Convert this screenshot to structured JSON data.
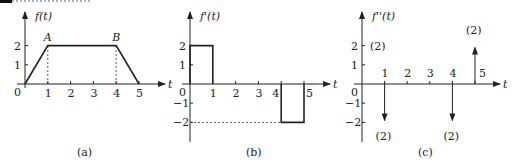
{
  "chart_data": [
    {
      "type": "line",
      "panel": "a",
      "caption": "(a)",
      "ylabel": "f(t)",
      "xlabel": "t",
      "x_ticks": [
        "1",
        "2",
        "3",
        "4",
        "5"
      ],
      "y_ticks": [
        "1",
        "2"
      ],
      "origin_label": "0",
      "points": [
        [
          0,
          0
        ],
        [
          1,
          2
        ],
        [
          4,
          2
        ],
        [
          5,
          0
        ]
      ],
      "annotations": [
        {
          "label": "A",
          "x": 1,
          "y": 2
        },
        {
          "label": "B",
          "x": 4,
          "y": 2
        }
      ],
      "dashed_guides": [
        {
          "x": 1,
          "from": 0,
          "to": 2
        },
        {
          "x": 4,
          "from": 0,
          "to": 2
        }
      ],
      "xlim": [
        0,
        5.5
      ],
      "ylim": [
        0,
        3
      ]
    },
    {
      "type": "line",
      "panel": "b",
      "caption": "(b)",
      "ylabel": "f'(t)",
      "xlabel": "t",
      "x_ticks": [
        "1",
        "2",
        "3",
        "4",
        "5"
      ],
      "y_ticks": [
        "2",
        "1",
        "-1",
        "-2"
      ],
      "origin_label": "0",
      "segments": [
        {
          "x_start": 0,
          "x_end": 1,
          "value": 2
        },
        {
          "x_start": 4,
          "x_end": 5,
          "value": -2
        }
      ],
      "dashed_guides": [
        {
          "y": -2,
          "from": 0,
          "to": 4
        }
      ],
      "xlim": [
        0,
        5.5
      ],
      "ylim": [
        -2.8,
        3
      ]
    },
    {
      "type": "impulse",
      "panel": "c",
      "caption": "(c)",
      "ylabel": "f''(t)",
      "xlabel": "t",
      "x_ticks": [
        "1",
        "2",
        "3",
        "4",
        "5"
      ],
      "y_ticks": [
        "2",
        "1",
        "-1",
        "-2"
      ],
      "origin_label": "0",
      "impulses": [
        {
          "x": 0,
          "weight": 2,
          "label": "(2)"
        },
        {
          "x": 1,
          "weight": -2,
          "label": "(2)"
        },
        {
          "x": 4,
          "weight": -2,
          "label": "(2)"
        },
        {
          "x": 5,
          "weight": 2,
          "label": "(2)"
        }
      ],
      "xlim": [
        0,
        5.5
      ],
      "ylim": [
        -2.8,
        3
      ]
    }
  ]
}
